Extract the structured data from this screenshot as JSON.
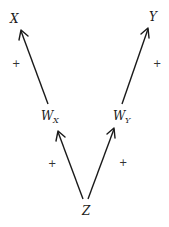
{
  "diagram": {
    "type": "causal-path-diagram",
    "nodes": [
      {
        "id": "X",
        "label": "X",
        "subscript": ""
      },
      {
        "id": "Y",
        "label": "Y",
        "subscript": ""
      },
      {
        "id": "WX",
        "label": "W",
        "subscript": "X"
      },
      {
        "id": "WY",
        "label": "W",
        "subscript": "Y"
      },
      {
        "id": "Z",
        "label": "Z",
        "subscript": ""
      }
    ],
    "edges": [
      {
        "from": "Z",
        "to": "WX",
        "sign": "+"
      },
      {
        "from": "Z",
        "to": "WY",
        "sign": "+"
      },
      {
        "from": "WX",
        "to": "X",
        "sign": "+"
      },
      {
        "from": "WY",
        "to": "Y",
        "sign": "+"
      }
    ]
  }
}
